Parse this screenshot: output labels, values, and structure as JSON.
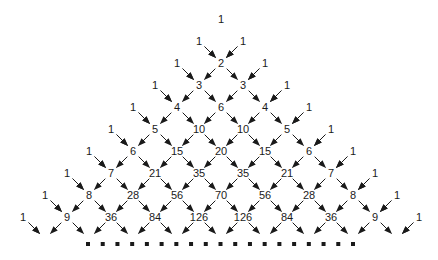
{
  "diagram": {
    "rows": [
      [
        1
      ],
      [
        1,
        1
      ],
      [
        1,
        2,
        1
      ],
      [
        1,
        3,
        3,
        1
      ],
      [
        1,
        4,
        6,
        4,
        1
      ],
      [
        1,
        5,
        10,
        10,
        5,
        1
      ],
      [
        1,
        6,
        15,
        20,
        15,
        6,
        1
      ],
      [
        1,
        7,
        21,
        35,
        35,
        21,
        7,
        1
      ],
      [
        1,
        8,
        28,
        56,
        70,
        56,
        28,
        8,
        1
      ],
      [
        1,
        9,
        36,
        84,
        126,
        126,
        84,
        36,
        9,
        1
      ]
    ],
    "continuation_marker": "dotted row",
    "continuation_dot_count": 19,
    "arrow_color": "#1a1a1a",
    "text_color": "#1a1a1a"
  }
}
